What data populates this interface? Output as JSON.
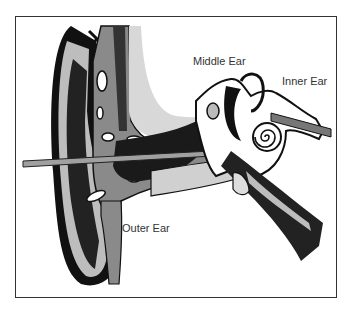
{
  "diagram": {
    "labels": {
      "middle_ear": "Middle Ear",
      "inner_ear": "Inner Ear",
      "outer_ear": "Outer Ear"
    },
    "colors": {
      "outline": "#111111",
      "tissue_gray": "#8a8a8a",
      "light_gray": "#cfcfcf",
      "background": "#ffffff",
      "frame": "#333333"
    }
  }
}
